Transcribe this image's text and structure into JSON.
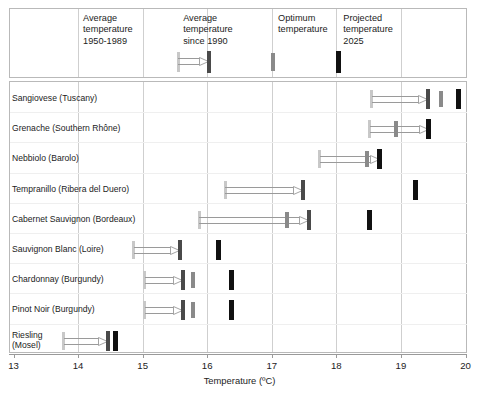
{
  "chart_data": {
    "type": "bar",
    "title": "",
    "xlabel": "Temperature (ºC)",
    "ylabel": "",
    "xlim": [
      13,
      20
    ],
    "xticks": [
      13,
      14,
      15,
      16,
      17,
      18,
      19,
      20
    ],
    "xtick_labels": [
      "13",
      "14",
      "15",
      "16",
      "17",
      "18",
      "19",
      "20"
    ],
    "grid": true,
    "legend_position": "top",
    "series": [
      {
        "name": "Average temperature 1950-1989",
        "key": "past",
        "color": "#c8c8c8"
      },
      {
        "name": "Average temperature since 1990",
        "key": "recent",
        "color": "#4a4a4a"
      },
      {
        "name": "Optimum temperature",
        "key": "optimum",
        "color": "#8a8a8a"
      },
      {
        "name": "Projected temperature 2025",
        "key": "proj",
        "color": "#111111"
      }
    ],
    "categories": [
      "Sangiovese (Tuscany)",
      "Grenache (Southern Rhône)",
      "Nebbiolo (Barolo)",
      "Tempranillo (Ribera del Duero)",
      "Cabernet Sauvignon (Bordeaux)",
      "Sauvignon Blanc (Loire)",
      "Chardonnay (Burgundy)",
      "Pinot Noir (Burgundy)",
      "Riesling\n(Mosel)"
    ],
    "rows": [
      {
        "label": "Sangiovese (Tuscany)",
        "past": 18.55,
        "recent": 19.42,
        "optimum": 19.62,
        "proj": 19.89
      },
      {
        "label": "Grenache (Southern Rhône)",
        "past": 18.52,
        "recent": 19.43,
        "optimum": 18.93,
        "proj": 19.43
      },
      {
        "label": "Nebbiolo (Barolo)",
        "past": 17.74,
        "recent": 18.67,
        "optimum": 18.48,
        "proj": 18.67
      },
      {
        "label": "Tempranillo (Ribera del Duero)",
        "past": 16.28,
        "recent": 17.48,
        "optimum": 17.48,
        "proj": 19.23
      },
      {
        "label": "Cabernet Sauvignon (Bordeaux)",
        "past": 15.88,
        "recent": 17.57,
        "optimum": 17.23,
        "proj": 18.52
      },
      {
        "label": "Sauvignon Blanc (Loire)",
        "past": 14.86,
        "recent": 15.58,
        "optimum": 15.58,
        "proj": 16.18
      },
      {
        "label": "Chardonnay (Burgundy)",
        "past": 15.03,
        "recent": 15.63,
        "optimum": 15.78,
        "proj": 16.38
      },
      {
        "label": "Pinot Noir (Burgundy)",
        "past": 15.03,
        "recent": 15.63,
        "optimum": 15.78,
        "proj": 16.38
      },
      {
        "label": "Riesling\n(Mosel)",
        "past": 13.78,
        "recent": 14.46,
        "optimum": 14.46,
        "proj": 14.58
      }
    ]
  },
  "legend": {
    "items": [
      {
        "id": "past",
        "label": "Average\ntemperature\n1950-1989"
      },
      {
        "id": "recent",
        "label": "Average\ntemperature\nsince 1990"
      },
      {
        "id": "optimum",
        "label": "Optimum\ntemperature"
      },
      {
        "id": "proj",
        "label": "Projected\ntemperature\n2025"
      }
    ],
    "sample_past": 15.55,
    "sample_recent": 16.03,
    "sample_optimum": 17.02,
    "sample_proj": 18.03
  },
  "axis": {
    "title": "Temperature (ºC)",
    "ticks": [
      "13",
      "14",
      "15",
      "16",
      "17",
      "18",
      "19",
      "20"
    ]
  },
  "rows": [
    {
      "label": "Sangiovese (Tuscany)"
    },
    {
      "label": "Grenache (Southern Rhône)"
    },
    {
      "label": "Nebbiolo (Barolo)"
    },
    {
      "label": "Tempranillo (Ribera del Duero)"
    },
    {
      "label": "Cabernet Sauvignon (Bordeaux)"
    },
    {
      "label": "Sauvignon Blanc (Loire)"
    },
    {
      "label": "Chardonnay (Burgundy)"
    },
    {
      "label": "Pinot Noir (Burgundy)"
    },
    {
      "label": "Riesling\n(Mosel)"
    }
  ],
  "colors": {
    "past": "#c8c8c8",
    "recent": "#4a4a4a",
    "optimum": "#8a8a8a",
    "proj": "#111111",
    "frame": "#b9b9b9",
    "grid": "#cfcfcf"
  }
}
